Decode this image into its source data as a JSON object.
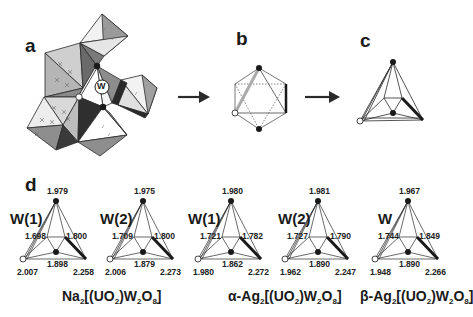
{
  "panels": {
    "a": {
      "label": "a",
      "center_atom": "W"
    },
    "b": {
      "label": "b"
    },
    "c": {
      "label": "c"
    },
    "d": {
      "label": "d"
    }
  },
  "colors": {
    "dark_face": "#6e6e6e",
    "mid_face": "#9a9a9a",
    "light_face": "#c9c9c9",
    "white_face": "#f4f4f4",
    "edge": "#2a2a2a",
    "atom_filled": "#1a1a1a",
    "atom_open": "#ffffff"
  },
  "diagrams": [
    {
      "site": "W(1)",
      "top": "1.979",
      "left_mid": "1.698",
      "right_mid": "1.800",
      "center_bottom": "1.898",
      "bottom_left": "2.007",
      "bottom_right": "2.258"
    },
    {
      "site": "W(2)",
      "top": "1.975",
      "left_mid": "1.709",
      "right_mid": "1.800",
      "center_bottom": "1.879",
      "bottom_left": "2.006",
      "bottom_right": "2.273"
    },
    {
      "site": "W(1)",
      "top": "1.980",
      "left_mid": "1.721",
      "right_mid": "1.782",
      "center_bottom": "1.862",
      "bottom_left": "1.980",
      "bottom_right": "2.272"
    },
    {
      "site": "W(2)",
      "top": "1.981",
      "left_mid": "1.727",
      "right_mid": "1.790",
      "center_bottom": "1.890",
      "bottom_left": "1.962",
      "bottom_right": "2.247"
    },
    {
      "site": "W",
      "top": "1.967",
      "left_mid": "1.744",
      "right_mid": "1.849",
      "center_bottom": "1.890",
      "bottom_left": "1.948",
      "bottom_right": "2.266"
    }
  ],
  "compounds": [
    {
      "prefix": "",
      "parts": [
        "Na",
        "2",
        "[(UO",
        "2",
        ")W",
        "2",
        "O",
        "8",
        "]"
      ]
    },
    {
      "prefix": "α-",
      "parts": [
        "Ag",
        "2",
        "[(UO",
        "2",
        ")W",
        "2",
        "O",
        "8",
        "]"
      ]
    },
    {
      "prefix": "β-",
      "parts": [
        "Ag",
        "2",
        "[(UO",
        "2",
        ")W",
        "2",
        "O",
        "8",
        "]"
      ]
    }
  ]
}
